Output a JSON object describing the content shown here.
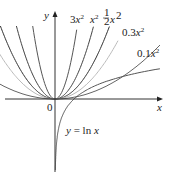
{
  "chart_data": {
    "type": "line",
    "title": "",
    "xlabel": "x",
    "ylabel": "y",
    "origin_label": "0",
    "grid": false,
    "series": [
      {
        "name": "3x^2",
        "a": 3,
        "color": "#555555"
      },
      {
        "name": "x^2",
        "a": 1,
        "color": "#444444"
      },
      {
        "name": "1/2 x^2",
        "a": 0.5,
        "color": "#333333"
      },
      {
        "name": "0.3x^2",
        "a": 0.3,
        "color": "#bbbbbb"
      },
      {
        "name": "0.1x^2",
        "a": 0.1,
        "color": "#666666"
      },
      {
        "name": "y = ln x",
        "color": "#555555"
      }
    ],
    "annotations": [
      "3x²",
      "x²",
      "½x²",
      "0.3x²",
      "0.1x²",
      "y = ln x"
    ]
  },
  "labels": {
    "y_axis": "y",
    "x_axis": "x",
    "origin": "0",
    "lbl_3x2": "3x",
    "lbl_x2": "x",
    "lbl_half": "x",
    "lbl_03": "0.3x",
    "lbl_01": "0.1x",
    "sup": "2",
    "ln": "y = ln x"
  }
}
